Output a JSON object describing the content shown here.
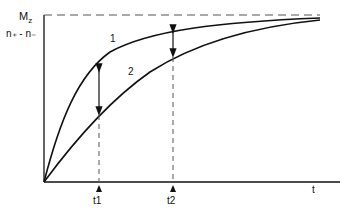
{
  "diagram": {
    "y_axis_labels": {
      "top": "M",
      "top_sub": "z",
      "second": "n₊ - n₋"
    },
    "x_axis_label": "t",
    "curves": [
      {
        "id": "1",
        "label": "1"
      },
      {
        "id": "2",
        "label": "2"
      }
    ],
    "time_markers": [
      {
        "label": "t1"
      },
      {
        "label": "t2"
      }
    ],
    "colors": {
      "stroke": "#111111",
      "dash": "#555555",
      "background": "#ffffff"
    }
  }
}
